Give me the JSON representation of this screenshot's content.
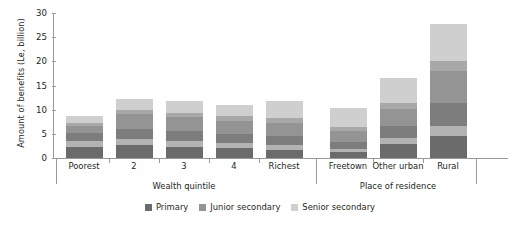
{
  "chart_data": {
    "type": "bar",
    "title": "",
    "xlabel": "",
    "ylabel": "Amount of benefits (Le, billion)",
    "ylim": [
      0,
      30
    ],
    "yticks": [
      0,
      5,
      10,
      15,
      20,
      25,
      30
    ],
    "grid": false,
    "stacked": true,
    "legend_position": "bottom-center",
    "categories": [
      "Poorest",
      "2",
      "3",
      "4",
      "Richest",
      "Freetown",
      "Other urban",
      "Rural"
    ],
    "groups": [
      {
        "label": "Wealth quintile",
        "categories": [
          "Poorest",
          "2",
          "3",
          "4",
          "Richest"
        ]
      },
      {
        "label": "Place of residence",
        "categories": [
          "Freetown",
          "Other urban",
          "Rural"
        ]
      }
    ],
    "series": [
      {
        "name": "Primary",
        "color": "#6b6b6b",
        "values": [
          3.6,
          4.0,
          3.6,
          3.2,
          2.6,
          1.9,
          4.1,
          6.7
        ]
      },
      {
        "name": "Junior secondary",
        "color": "#949494",
        "values": [
          3.1,
          5.1,
          4.9,
          4.5,
          4.6,
          3.6,
          6.0,
          11.4
        ]
      },
      {
        "name": "Senior secondary",
        "color": "#cfcfcf",
        "values": [
          2.1,
          3.2,
          3.3,
          3.3,
          4.6,
          4.9,
          6.5,
          9.7
        ]
      }
    ],
    "totals": [
      8.8,
      12.3,
      11.8,
      11.0,
      11.8,
      10.4,
      16.6,
      27.8
    ],
    "bar_bands": [
      [
        {
          "color": "#6b6b6b",
          "value": 2.3
        },
        {
          "color": "#b3b3b3",
          "value": 1.3
        },
        {
          "color": "#7d7d7d",
          "value": 1.5
        },
        {
          "color": "#949494",
          "value": 1.6
        },
        {
          "color": "#a8a8a8",
          "value": 0.6
        },
        {
          "color": "#cfcfcf",
          "value": 1.5
        }
      ],
      [
        {
          "color": "#6b6b6b",
          "value": 2.6
        },
        {
          "color": "#b3b3b3",
          "value": 1.4
        },
        {
          "color": "#7d7d7d",
          "value": 2.1
        },
        {
          "color": "#949494",
          "value": 3.0
        },
        {
          "color": "#a8a8a8",
          "value": 0.9
        },
        {
          "color": "#cfcfcf",
          "value": 2.3
        }
      ],
      [
        {
          "color": "#6b6b6b",
          "value": 2.3
        },
        {
          "color": "#b3b3b3",
          "value": 1.3
        },
        {
          "color": "#7d7d7d",
          "value": 2.0
        },
        {
          "color": "#949494",
          "value": 2.9
        },
        {
          "color": "#a8a8a8",
          "value": 0.9
        },
        {
          "color": "#cfcfcf",
          "value": 2.4
        }
      ],
      [
        {
          "color": "#6b6b6b",
          "value": 2.1
        },
        {
          "color": "#b3b3b3",
          "value": 1.1
        },
        {
          "color": "#7d7d7d",
          "value": 1.8
        },
        {
          "color": "#949494",
          "value": 2.7
        },
        {
          "color": "#a8a8a8",
          "value": 0.9
        },
        {
          "color": "#cfcfcf",
          "value": 2.4
        }
      ],
      [
        {
          "color": "#6b6b6b",
          "value": 1.7
        },
        {
          "color": "#b3b3b3",
          "value": 0.9
        },
        {
          "color": "#7d7d7d",
          "value": 1.9
        },
        {
          "color": "#949494",
          "value": 2.7
        },
        {
          "color": "#a8a8a8",
          "value": 1.0
        },
        {
          "color": "#cfcfcf",
          "value": 3.6
        }
      ],
      [
        {
          "color": "#6b6b6b",
          "value": 1.3
        },
        {
          "color": "#b3b3b3",
          "value": 0.6
        },
        {
          "color": "#7d7d7d",
          "value": 1.5
        },
        {
          "color": "#949494",
          "value": 2.1
        },
        {
          "color": "#a8a8a8",
          "value": 0.9
        },
        {
          "color": "#cfcfcf",
          "value": 4.0
        }
      ],
      [
        {
          "color": "#6b6b6b",
          "value": 2.8
        },
        {
          "color": "#b3b3b3",
          "value": 1.3
        },
        {
          "color": "#7d7d7d",
          "value": 2.5
        },
        {
          "color": "#949494",
          "value": 3.5
        },
        {
          "color": "#a8a8a8",
          "value": 1.2
        },
        {
          "color": "#cfcfcf",
          "value": 5.3
        }
      ],
      [
        {
          "color": "#6b6b6b",
          "value": 4.6
        },
        {
          "color": "#b3b3b3",
          "value": 2.1
        },
        {
          "color": "#7d7d7d",
          "value": 4.6
        },
        {
          "color": "#949494",
          "value": 6.8
        },
        {
          "color": "#a8a8a8",
          "value": 2.0
        },
        {
          "color": "#cfcfcf",
          "value": 7.7
        }
      ]
    ]
  },
  "legend": {
    "items": [
      {
        "label": "Primary",
        "color": "#6b6b6b"
      },
      {
        "label": "Junior secondary",
        "color": "#949494"
      },
      {
        "label": "Senior secondary",
        "color": "#cfcfcf"
      }
    ]
  },
  "colors": {
    "axis": "#9a9a9a",
    "text": "#231f20",
    "background": "#ffffff"
  }
}
